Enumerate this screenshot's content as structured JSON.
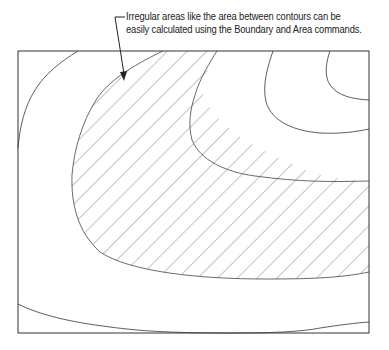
{
  "callout": {
    "line1": "Irregular areas like the area between contours can be",
    "line2": "easily calculated using the Boundary and Area commands."
  },
  "diagram": {
    "type": "contour-map",
    "frame": {
      "x": 18,
      "y": 51,
      "width": 351,
      "height": 282
    },
    "hatched_region_label": "area between contours",
    "colors": {
      "line": "#333333",
      "hatch": "#666666",
      "background": "#ffffff"
    }
  }
}
